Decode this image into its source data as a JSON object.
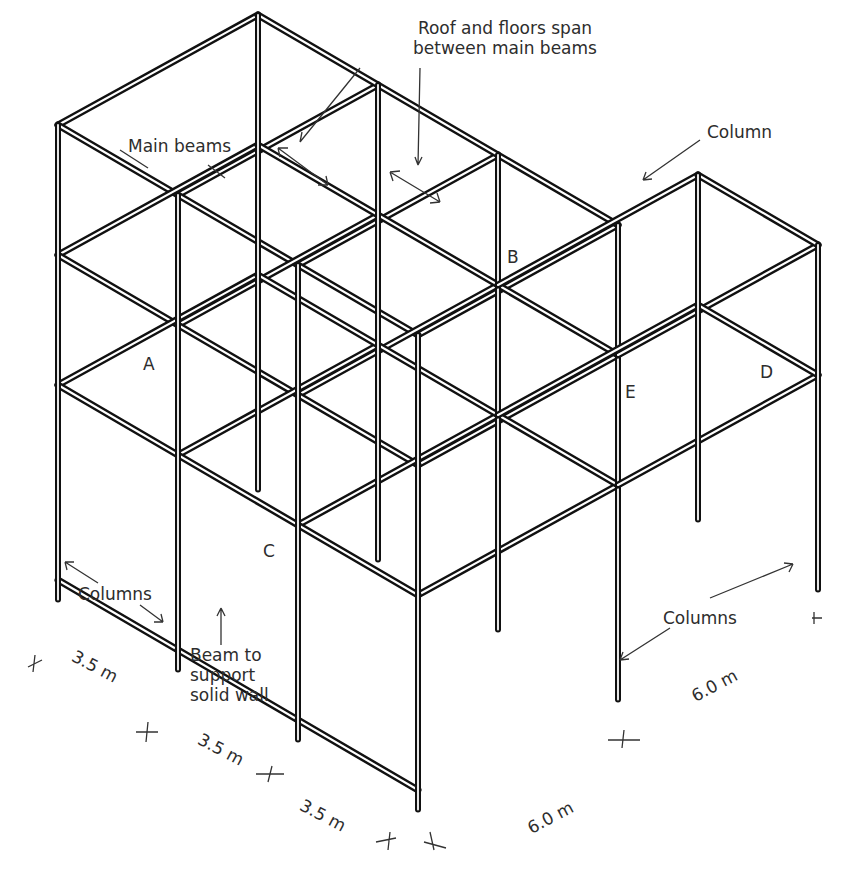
{
  "diagram": {
    "type": "isometric structural steel frame",
    "labels": {
      "roof_floors_span": "Roof and floors span between main beams",
      "roof_floors_span_line1": "Roof and floors span",
      "roof_floors_span_line2": "between main beams",
      "main_beams": "Main beams",
      "column": "Column",
      "columns_left": "Columns",
      "columns_right": "Columns",
      "beam_to_support_line1": "Beam to",
      "beam_to_support_line2": "support",
      "beam_to_support_line3": "solid wall"
    },
    "point_labels": {
      "A": "A",
      "B": "B",
      "C": "C",
      "D": "D",
      "E": "E"
    },
    "dimensions": {
      "bay1": "3.5 m",
      "bay2": "3.5 m",
      "bay3": "3.5 m",
      "depth_front": "6.0 m",
      "depth_right": "6.0 m"
    },
    "colors": {
      "line": "#111111",
      "text": "#2d2d2d",
      "background": "#ffffff"
    }
  }
}
